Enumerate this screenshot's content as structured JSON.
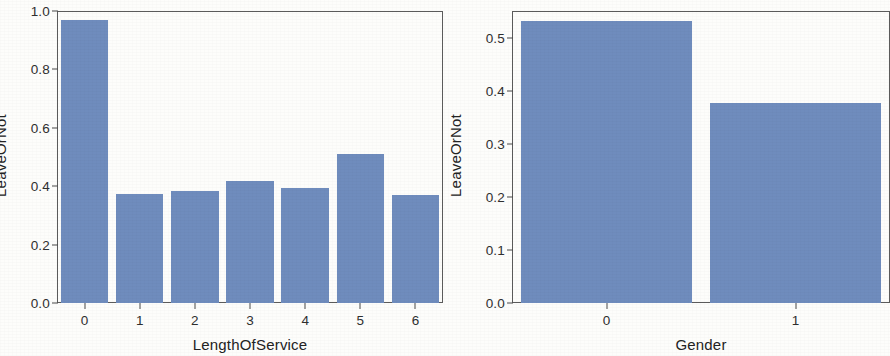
{
  "figure": {
    "bar_color": "#6f8cbd",
    "axis_color": "#4a4a4a",
    "text_color": "#2f2f2f",
    "background": "#fdfdfb"
  },
  "chart_data": [
    {
      "type": "bar",
      "title": "",
      "xlabel": "LengthOfService",
      "ylabel": "LeaveOrNot",
      "categories": [
        "0",
        "1",
        "2",
        "3",
        "4",
        "5",
        "6"
      ],
      "values": [
        0.968,
        0.372,
        0.385,
        0.418,
        0.393,
        0.512,
        0.37
      ],
      "ylim": [
        0.0,
        1.0
      ],
      "yticks": [
        "0.0",
        "0.2",
        "0.4",
        "0.6",
        "0.8",
        "1.0"
      ],
      "ytick_values": [
        0.0,
        0.2,
        0.4,
        0.6,
        0.8,
        1.0
      ],
      "grid": false,
      "legend": "none"
    },
    {
      "type": "bar",
      "title": "",
      "xlabel": "Gender",
      "ylabel": "LeaveOrNot",
      "categories": [
        "0",
        "1"
      ],
      "values": [
        0.532,
        0.376
      ],
      "ylim": [
        0.0,
        0.55
      ],
      "yticks": [
        "0.0",
        "0.1",
        "0.2",
        "0.3",
        "0.4",
        "0.5"
      ],
      "ytick_values": [
        0.0,
        0.1,
        0.2,
        0.3,
        0.4,
        0.5
      ],
      "grid": false,
      "legend": "none"
    }
  ]
}
